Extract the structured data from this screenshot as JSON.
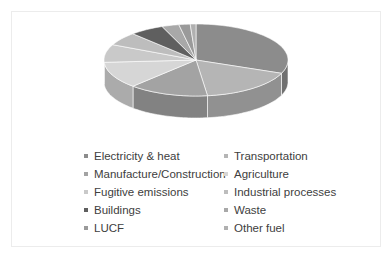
{
  "chart_data": {
    "type": "pie",
    "style": "3d",
    "title": "",
    "categories": [
      "Electricity & heat",
      "Transportation",
      "Manufacture/Construction",
      "Agriculture",
      "Fugitive emissions",
      "Industrial processes",
      "Buildings",
      "Waste",
      "LUCF",
      "Other fuel"
    ],
    "values": [
      31,
      17,
      14,
      12,
      8,
      6,
      6,
      3,
      2,
      1
    ],
    "unit": "%",
    "legend_position": "bottom",
    "colors": [
      "#8c8c8c",
      "#b5b5b5",
      "#a3a3a3",
      "#d6d6d6",
      "#c9c9c9",
      "#bdbdbd",
      "#5f5f5f",
      "#a8a8a8",
      "#9a9a9a",
      "#b0b0b0"
    ]
  },
  "legend": {
    "items": [
      {
        "label": "Electricity & heat",
        "color": "#8c8c8c"
      },
      {
        "label": "Transportation",
        "color": "#b5b5b5"
      },
      {
        "label": "Manufacture/Construction",
        "color": "#a3a3a3"
      },
      {
        "label": "Agriculture",
        "color": "#d6d6d6"
      },
      {
        "label": "Fugitive emissions",
        "color": "#c9c9c9"
      },
      {
        "label": "Industrial processes",
        "color": "#bdbdbd"
      },
      {
        "label": "Buildings",
        "color": "#5f5f5f"
      },
      {
        "label": "Waste",
        "color": "#a8a8a8"
      },
      {
        "label": "LUCF",
        "color": "#9a9a9a"
      },
      {
        "label": "Other fuel",
        "color": "#b0b0b0"
      }
    ]
  }
}
